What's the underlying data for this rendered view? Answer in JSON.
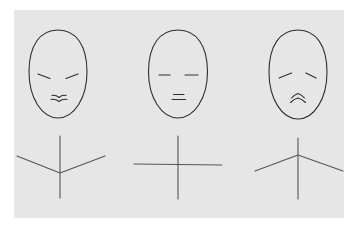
{
  "diagram": {
    "colors": {
      "page_background": "#ffffff",
      "paper": "#e6e6e6",
      "line": "#2e2e2e",
      "body_line": "#555555"
    },
    "paper": {
      "x": 14,
      "y": 10,
      "width": 330,
      "height": 208
    },
    "figures": [
      {
        "label": "happy",
        "face": {
          "cx": 58,
          "cy": 74,
          "rx": 29,
          "ry": 44
        },
        "eyes": [
          {
            "x1": 38,
            "y1": 74,
            "x2": 50,
            "y2": 78.5
          },
          {
            "x1": 66,
            "y1": 78.5,
            "x2": 78,
            "y2": 74
          }
        ],
        "mouth": [
          "M52 95.5 Q55.5 94.5 59 97.5 Q62.5 94.5 66 95.5",
          "M51 99.5 Q55 98.5 59 101.5 Q63 98.5 67 99.5"
        ],
        "body": {
          "spine": {
            "x1": 60,
            "y1": 136,
            "x2": 60,
            "y2": 198
          },
          "arms": "M17 156 L60 173 L105 156"
        }
      },
      {
        "label": "neutral",
        "face": {
          "cx": 178,
          "cy": 74,
          "rx": 29.5,
          "ry": 44
        },
        "eyes": [
          {
            "x1": 159,
            "y1": 75,
            "x2": 170,
            "y2": 75
          },
          {
            "x1": 185,
            "y1": 75,
            "x2": 198,
            "y2": 75
          }
        ],
        "mouth": [
          "M173.5 94.5 L184 94.5",
          "M172 99.5 L185.5 99.5"
        ],
        "body": {
          "spine": {
            "x1": 178,
            "y1": 136,
            "x2": 178,
            "y2": 199
          },
          "arms": "M134 164 L222 165"
        }
      },
      {
        "label": "sad",
        "face": {
          "cx": 298,
          "cy": 74.5,
          "rx": 29,
          "ry": 44.5
        },
        "eyes": [
          {
            "x1": 279,
            "y1": 78,
            "x2": 291.5,
            "y2": 73
          },
          {
            "x1": 306,
            "y1": 73,
            "x2": 316,
            "y2": 78
          }
        ],
        "mouth": [
          "M291.5 98 Q294 95 298 93.5 Q302 95 304.5 98",
          "M290.5 102.5 Q294 99 298 98 Q302 99 305.5 102.5"
        ],
        "body": {
          "spine": {
            "x1": 298,
            "y1": 138,
            "x2": 298,
            "y2": 199
          },
          "arms": "M255 171 L298 155 L343 171"
        }
      }
    ]
  }
}
